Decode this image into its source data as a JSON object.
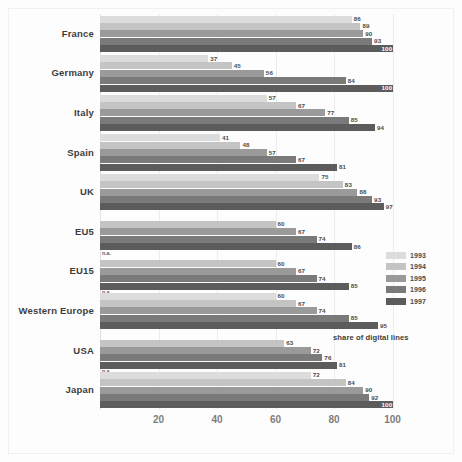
{
  "chart_data": {
    "type": "bar",
    "orientation": "horizontal",
    "title": "",
    "annotation": "share of digital lines",
    "xlabel": "",
    "ylabel": "",
    "xlim": [
      0,
      108
    ],
    "xticks": [
      20,
      40,
      60,
      80,
      100
    ],
    "grid": true,
    "legend_position": "right",
    "categories": [
      "France",
      "Germany",
      "Italy",
      "Spain",
      "UK",
      "EU5",
      "EU15",
      "Western Europe",
      "USA",
      "Japan"
    ],
    "series": [
      {
        "name": "1993",
        "color": "#dcdcdc",
        "values": [
          86,
          37,
          57,
          41,
          75,
          null,
          null,
          60,
          null,
          72
        ]
      },
      {
        "name": "1994",
        "color": "#c4c4c4",
        "values": [
          89,
          45,
          67,
          48,
          83,
          60,
          60,
          67,
          63,
          84
        ]
      },
      {
        "name": "1995",
        "color": "#9a9a9a",
        "values": [
          90,
          56,
          77,
          57,
          88,
          67,
          67,
          74,
          72,
          90
        ]
      },
      {
        "name": "1996",
        "color": "#7a7a7a",
        "values": [
          93,
          84,
          85,
          67,
          93,
          74,
          74,
          85,
          76,
          92
        ]
      },
      {
        "name": "1997",
        "color": "#5c5c5c",
        "values": [
          100,
          100,
          94,
          81,
          97,
          86,
          85,
          95,
          81,
          100
        ]
      }
    ],
    "missing_label": "n.a.",
    "missing_cells": [
      {
        "category": "EU5",
        "series": "1993"
      },
      {
        "category": "EU15",
        "series": "1993"
      },
      {
        "category": "USA",
        "series": "1993"
      }
    ]
  },
  "legend": {
    "entries": [
      {
        "label": "1993",
        "color": "#dcdcdc"
      },
      {
        "label": "1994",
        "color": "#c4c4c4"
      },
      {
        "label": "1995",
        "color": "#9a9a9a"
      },
      {
        "label": "1996",
        "color": "#7a7a7a"
      },
      {
        "label": "1997",
        "color": "#5c5c5c"
      }
    ]
  },
  "colors": {
    "background": "#fdfdfd",
    "frame": "#f0f0f0",
    "gridline": "#ececec",
    "label_text": "#3d3d3d",
    "value_text": "#4a4a4a",
    "tick_text": "#7d7d7d"
  }
}
